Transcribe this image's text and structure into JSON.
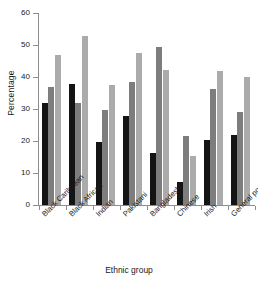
{
  "chart_data": {
    "type": "bar",
    "title": "",
    "subtitle": "",
    "xlabel": "Ethnic group",
    "ylabel": "Percentage",
    "ylim": [
      0,
      60
    ],
    "yticks": [
      0,
      10,
      20,
      30,
      40,
      50,
      60
    ],
    "ytick_labels": [
      "0",
      "10",
      "20",
      "30",
      "40",
      "50",
      "60"
    ],
    "grid": false,
    "legend": "none",
    "categories": [
      "Black Caribbean",
      "Black African",
      "Indian",
      "Pakistani",
      "Bangladeshi",
      "Chinese",
      "Irish",
      "General population"
    ],
    "series": [
      {
        "name": "series-1",
        "color": "#141414",
        "values": [
          32.0,
          37.8,
          19.8,
          27.7,
          16.3,
          7.2,
          20.3,
          22.0
        ]
      },
      {
        "name": "series-2",
        "color": "#7d7d7d",
        "values": [
          37.0,
          32.0,
          29.8,
          38.5,
          49.4,
          21.5,
          36.1,
          29.2
        ]
      },
      {
        "name": "series-3",
        "color": "#ababab",
        "values": [
          46.8,
          52.9,
          37.5,
          47.5,
          42.3,
          15.3,
          42.0,
          40.0
        ]
      }
    ]
  }
}
